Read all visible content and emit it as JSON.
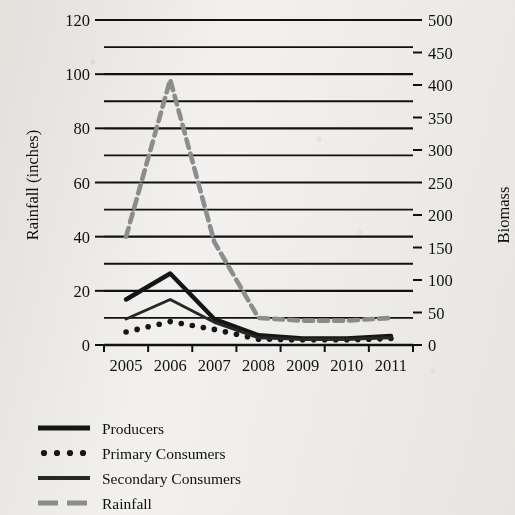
{
  "chart_data": {
    "type": "line",
    "title": "",
    "xlabel": "",
    "ylabel": "Rainfall (inches)",
    "y2label": "Biomass",
    "x": [
      2005,
      2006,
      2007,
      2008,
      2009,
      2010,
      2011
    ],
    "categories": [
      "2005",
      "2006",
      "2007",
      "2008",
      "2009",
      "2010",
      "2011"
    ],
    "ylim": [
      0,
      120
    ],
    "y2lim": [
      0,
      500
    ],
    "yticks": [
      0,
      20,
      40,
      60,
      80,
      100,
      120
    ],
    "yticklabels": [
      "0",
      "20",
      "40",
      "60",
      "80",
      "100",
      "120"
    ],
    "y2ticks": [
      0,
      50,
      100,
      150,
      200,
      250,
      300,
      350,
      400,
      450,
      500
    ],
    "y2ticklabels": [
      "0",
      "50",
      "100",
      "150",
      "200",
      "250",
      "300",
      "350",
      "400",
      "450",
      "500"
    ],
    "gridlines_y": [
      10,
      20,
      30,
      40,
      50,
      60,
      70,
      80,
      90,
      100,
      110,
      120
    ],
    "grid": true,
    "legend_position": "below",
    "series": [
      {
        "name": "Producers",
        "style": "solid-thick",
        "color": "#151515",
        "axis": "right",
        "values": [
          70,
          110,
          40,
          15,
          10,
          10,
          14
        ]
      },
      {
        "name": "Primary Consumers",
        "style": "dotted",
        "color": "#151515",
        "axis": "right",
        "values": [
          20,
          36,
          24,
          9,
          8,
          8,
          10
        ]
      },
      {
        "name": "Secondary Consumers",
        "style": "solid-medium",
        "color": "#272727",
        "axis": "right",
        "values": [
          40,
          70,
          35,
          11,
          9,
          9,
          11
        ]
      },
      {
        "name": "Rainfall",
        "style": "dashed",
        "color": "#8e8e8e",
        "axis": "left",
        "values": [
          40,
          98,
          38,
          10,
          9,
          9,
          10
        ]
      }
    ]
  },
  "legend": {
    "items": [
      {
        "label": "Producers",
        "swatch": "solid-thick-swatch"
      },
      {
        "label": "Primary Consumers",
        "swatch": "dotted-swatch"
      },
      {
        "label": "Secondary Consumers",
        "swatch": "solid-medium-swatch"
      },
      {
        "label": "Rainfall",
        "swatch": "dashed-gray-swatch"
      }
    ]
  },
  "axes": {
    "left_title": "Rainfall (inches)",
    "right_title": "Biomass"
  }
}
